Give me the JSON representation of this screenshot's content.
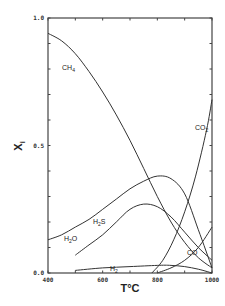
{
  "chart_data": {
    "type": "line",
    "title": "",
    "xlabel": "T°C",
    "ylabel": "X",
    "ylabel_subscript": "i",
    "xlim": [
      400,
      1000
    ],
    "ylim": [
      0.0,
      1.0
    ],
    "x_ticks": [
      400,
      500,
      600,
      700,
      800,
      900,
      1000
    ],
    "x_tick_labels": [
      "400",
      "600",
      "800",
      "1000"
    ],
    "y_ticks": [
      0.0,
      0.1,
      0.2,
      0.3,
      0.4,
      0.5,
      0.6,
      0.7,
      0.8,
      0.9,
      1.0
    ],
    "y_tick_labels": [
      "0.0",
      "0.5",
      "1.0"
    ],
    "grid": false,
    "legend": "inline labels",
    "series": [
      {
        "name": "CH4",
        "label_main": "CH",
        "label_sub": "4",
        "x": [
          400,
          450,
          500,
          550,
          600,
          650,
          700,
          750,
          800,
          850,
          900,
          950,
          1000
        ],
        "values": [
          0.94,
          0.91,
          0.86,
          0.79,
          0.71,
          0.62,
          0.52,
          0.41,
          0.3,
          0.2,
          0.12,
          0.06,
          0.02
        ]
      },
      {
        "name": "H2O",
        "label_main": "H",
        "label_sub": "2",
        "label_tail": "O",
        "x": [
          400,
          450,
          500,
          550,
          600,
          650,
          700,
          750,
          800,
          850,
          900,
          950,
          1000
        ],
        "values": [
          0.13,
          0.15,
          0.18,
          0.21,
          0.25,
          0.29,
          0.33,
          0.36,
          0.38,
          0.37,
          0.31,
          0.17,
          0.02
        ]
      },
      {
        "name": "H2S",
        "label_main": "H",
        "label_sub": "2",
        "label_tail": "S",
        "x": [
          500,
          550,
          600,
          650,
          700,
          750,
          800,
          850,
          900,
          950,
          1000
        ],
        "values": [
          0.07,
          0.11,
          0.15,
          0.2,
          0.25,
          0.27,
          0.26,
          0.22,
          0.16,
          0.1,
          0.05
        ]
      },
      {
        "name": "H2",
        "label_main": "H",
        "label_sub": "2",
        "x": [
          500,
          600,
          700,
          800,
          850,
          900,
          950,
          1000
        ],
        "values": [
          0.01,
          0.02,
          0.025,
          0.03,
          0.03,
          0.025,
          0.015,
          0.0
        ]
      },
      {
        "name": "CO2",
        "label_main": "CO",
        "label_sub": "2",
        "x": [
          780,
          820,
          860,
          900,
          940,
          980,
          1000
        ],
        "values": [
          0.0,
          0.05,
          0.13,
          0.24,
          0.38,
          0.56,
          0.68
        ]
      },
      {
        "name": "CO",
        "label_main": "CO",
        "label_sub": "",
        "x": [
          800,
          850,
          900,
          950,
          1000
        ],
        "values": [
          0.0,
          0.02,
          0.05,
          0.1,
          0.18
        ]
      }
    ]
  }
}
